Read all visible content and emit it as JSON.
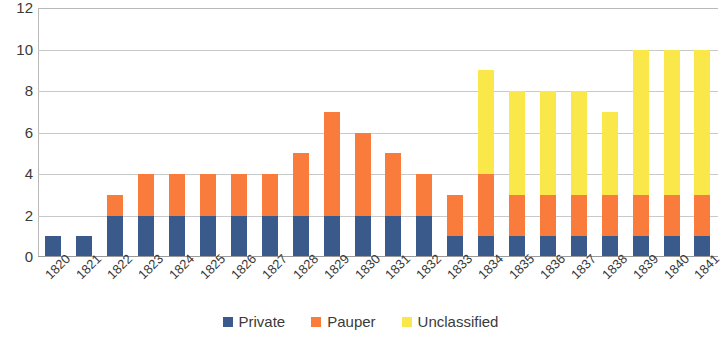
{
  "chart_data": {
    "type": "bar",
    "stacked": true,
    "title": "",
    "subtitle": "",
    "xlabel": "",
    "ylabel": "",
    "ylim": [
      0,
      12
    ],
    "ytick_step": 2,
    "yticks": [
      12,
      10,
      8,
      6,
      4,
      2,
      0
    ],
    "grid": true,
    "legend_position": "bottom",
    "categories": [
      "1820",
      "1821",
      "1822",
      "1823",
      "1824",
      "1825",
      "1826",
      "1827",
      "1828",
      "1829",
      "1830",
      "1831",
      "1832",
      "1833",
      "1834",
      "1835",
      "1836",
      "1837",
      "1838",
      "1839",
      "1840",
      "1841"
    ],
    "series": [
      {
        "name": "Private",
        "color": "#3b5a8c",
        "values": [
          1,
          1,
          2,
          2,
          2,
          2,
          2,
          2,
          2,
          2,
          2,
          2,
          2,
          1,
          1,
          1,
          1,
          1,
          1,
          1,
          1,
          1
        ]
      },
      {
        "name": "Pauper",
        "color": "#f97c3c",
        "values": [
          0,
          0,
          1,
          2,
          2,
          2,
          2,
          2,
          3,
          5,
          4,
          3,
          2,
          2,
          3,
          2,
          2,
          2,
          2,
          2,
          2,
          2
        ]
      },
      {
        "name": "Unclassified",
        "color": "#fae84b",
        "values": [
          0,
          0,
          0,
          0,
          0,
          0,
          0,
          0,
          0,
          0,
          0,
          0,
          0,
          0,
          5,
          5,
          5,
          5,
          4,
          7,
          7,
          7
        ]
      }
    ],
    "totals": [
      1,
      1,
      3,
      4,
      4,
      4,
      4,
      4,
      5,
      7,
      6,
      5,
      4,
      3,
      9,
      8,
      8,
      8,
      7,
      10,
      10,
      10
    ]
  }
}
